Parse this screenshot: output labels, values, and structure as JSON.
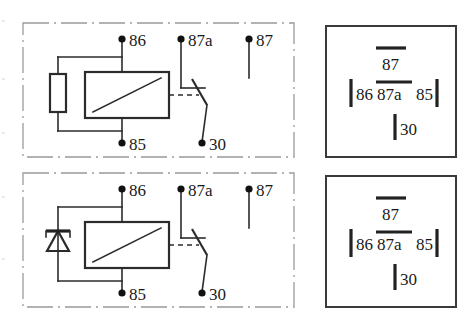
{
  "figure": {
    "background_color": "#ffffff",
    "line_color": "#2b2b2b",
    "frame_color": "#9a9a9a"
  },
  "panels": [
    {
      "id": "top",
      "variant": "resistor",
      "schematic": {
        "name": "relay-schematic-with-resistor",
        "coil_element": "resistor",
        "terminals": [
          {
            "name": "86",
            "label": "86",
            "role": "coil-positive"
          },
          {
            "name": "87a",
            "label": "87a",
            "role": "normally-closed"
          },
          {
            "name": "87",
            "label": "87",
            "role": "normally-open"
          },
          {
            "name": "85",
            "label": "85",
            "role": "coil-negative"
          },
          {
            "name": "30",
            "label": "30",
            "role": "common"
          }
        ]
      },
      "pinout": {
        "name": "relay-pinout-box",
        "blades": [
          {
            "name": "87",
            "label": "87",
            "orientation": "horizontal"
          },
          {
            "name": "86",
            "label": "86",
            "orientation": "vertical"
          },
          {
            "name": "87a",
            "label": "87a",
            "orientation": "horizontal"
          },
          {
            "name": "85",
            "label": "85",
            "orientation": "vertical"
          },
          {
            "name": "30",
            "label": "30",
            "orientation": "vertical"
          }
        ]
      }
    },
    {
      "id": "bottom",
      "variant": "diode",
      "schematic": {
        "name": "relay-schematic-with-diode",
        "coil_element": "diode",
        "terminals": [
          {
            "name": "86",
            "label": "86",
            "role": "coil-positive"
          },
          {
            "name": "87a",
            "label": "87a",
            "role": "normally-closed"
          },
          {
            "name": "87",
            "label": "87",
            "role": "normally-open"
          },
          {
            "name": "85",
            "label": "85",
            "role": "coil-negative"
          },
          {
            "name": "30",
            "label": "30",
            "role": "common"
          }
        ]
      },
      "pinout": {
        "name": "relay-pinout-box",
        "blades": [
          {
            "name": "87",
            "label": "87",
            "orientation": "horizontal"
          },
          {
            "name": "86",
            "label": "86",
            "orientation": "vertical"
          },
          {
            "name": "87a",
            "label": "87a",
            "orientation": "horizontal"
          },
          {
            "name": "85",
            "label": "85",
            "orientation": "vertical"
          },
          {
            "name": "30",
            "label": "30",
            "orientation": "vertical"
          }
        ]
      }
    }
  ]
}
